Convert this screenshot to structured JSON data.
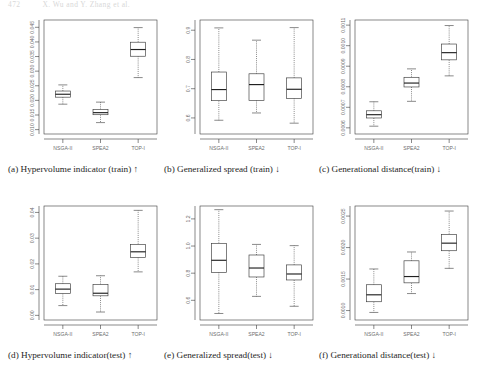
{
  "header": {
    "page_number": "472",
    "title": "X. Wu and Y. Zhang et al."
  },
  "axis": {
    "categories": [
      "NSGA-II",
      "SPEA2",
      "TOP-I"
    ]
  },
  "chart_data": [
    {
      "id": "a",
      "type": "boxplot",
      "title": "",
      "caption_label": "(a)",
      "caption_text": "Hypervolume indicator (train)",
      "caption_arrow": "↑",
      "xlabel": "",
      "ylabel": "",
      "categories": [
        "NSGA-II",
        "SPEA2",
        "TOP-I"
      ],
      "ylim": [
        0.0085,
        0.0475
      ],
      "yticks": [
        0.01,
        0.015,
        0.02,
        0.025,
        0.03,
        0.035,
        0.04,
        0.045
      ],
      "yticklabels": [
        "0.010",
        "0.015",
        "0.020",
        "0.025",
        "0.030",
        "0.035",
        "0.040",
        "0.045"
      ],
      "grid": false,
      "boxes": [
        {
          "name": "NSGA-II",
          "whisker_low": 0.0187,
          "q1": 0.0211,
          "median": 0.0221,
          "q3": 0.0232,
          "whisker_high": 0.0253
        },
        {
          "name": "SPEA2",
          "whisker_low": 0.0124,
          "q1": 0.0151,
          "median": 0.0158,
          "q3": 0.0169,
          "whisker_high": 0.0194
        },
        {
          "name": "TOP-I",
          "whisker_low": 0.0278,
          "q1": 0.0351,
          "median": 0.0374,
          "q3": 0.0399,
          "whisker_high": 0.0449
        }
      ]
    },
    {
      "id": "b",
      "type": "boxplot",
      "title": "",
      "caption_label": "(b)",
      "caption_text": "Generalized spread (train)",
      "caption_arrow": "↓",
      "xlabel": "",
      "ylabel": "",
      "categories": [
        "NSGA-II",
        "SPEA2",
        "TOP-I"
      ],
      "ylim": [
        0.545,
        0.935
      ],
      "yticks": [
        0.6,
        0.7,
        0.8,
        0.9
      ],
      "yticklabels": [
        "0.6",
        "0.7",
        "0.8",
        "0.9"
      ],
      "grid": false,
      "boxes": [
        {
          "name": "NSGA-II",
          "whisker_low": 0.592,
          "q1": 0.659,
          "median": 0.697,
          "q3": 0.757,
          "whisker_high": 0.908
        },
        {
          "name": "SPEA2",
          "whisker_low": 0.617,
          "q1": 0.66,
          "median": 0.714,
          "q3": 0.751,
          "whisker_high": 0.866
        },
        {
          "name": "TOP-I",
          "whisker_low": 0.582,
          "q1": 0.667,
          "median": 0.698,
          "q3": 0.737,
          "whisker_high": 0.909
        }
      ]
    },
    {
      "id": "c",
      "type": "boxplot",
      "title": "",
      "caption_label": "(c)",
      "caption_text": "Generational distance(train)",
      "caption_arrow": "↓",
      "xlabel": "",
      "ylabel": "",
      "categories": [
        "NSGA-II",
        "SPEA2",
        "TOP-I"
      ],
      "ylim": [
        0.00057,
        0.001125
      ],
      "yticks": [
        0.0006,
        0.0007,
        0.0008,
        0.0009,
        0.001,
        0.0011
      ],
      "yticklabels": [
        "0.0006",
        "0.0007",
        "0.0008",
        "0.0009",
        "0.0010",
        "0.0011"
      ],
      "grid": false,
      "boxes": [
        {
          "name": "NSGA-II",
          "whisker_low": 0.000608,
          "q1": 0.000648,
          "median": 0.000664,
          "q3": 0.000683,
          "whisker_high": 0.000727
        },
        {
          "name": "SPEA2",
          "whisker_low": 0.000729,
          "q1": 0.000799,
          "median": 0.000818,
          "q3": 0.000846,
          "whisker_high": 0.000887
        },
        {
          "name": "TOP-I",
          "whisker_low": 0.000853,
          "q1": 0.000931,
          "median": 0.000966,
          "q3": 0.001008,
          "whisker_high": 0.001098
        }
      ]
    },
    {
      "id": "d",
      "type": "boxplot",
      "title": "",
      "caption_label": "(d)",
      "caption_text": "Hypervolume indicator(test)",
      "caption_arrow": "↑",
      "xlabel": "",
      "ylabel": "",
      "categories": [
        "NSGA-II",
        "SPEA2",
        "TOP-I"
      ],
      "ylim": [
        -0.0018,
        0.0425
      ],
      "yticks": [
        0.0,
        0.01,
        0.02,
        0.03,
        0.04
      ],
      "yticklabels": [
        "0.00",
        "0.01",
        "0.02",
        "0.03",
        "0.04"
      ],
      "grid": false,
      "boxes": [
        {
          "name": "NSGA-II",
          "whisker_low": 0.0038,
          "q1": 0.0085,
          "median": 0.0102,
          "q3": 0.0123,
          "whisker_high": 0.0152
        },
        {
          "name": "SPEA2",
          "whisker_low": 0.0013,
          "q1": 0.0076,
          "median": 0.0086,
          "q3": 0.012,
          "whisker_high": 0.0154
        },
        {
          "name": "TOP-I",
          "whisker_low": 0.0169,
          "q1": 0.0225,
          "median": 0.0247,
          "q3": 0.0276,
          "whisker_high": 0.0408
        }
      ]
    },
    {
      "id": "e",
      "type": "boxplot",
      "title": "",
      "caption_label": "(e)",
      "caption_text": "Generalized spread(test)",
      "caption_arrow": "↓",
      "xlabel": "",
      "ylabel": "",
      "categories": [
        "NSGA-II",
        "SPEA2",
        "TOP-I"
      ],
      "ylim": [
        0.455,
        1.295
      ],
      "yticks": [
        0.6,
        0.8,
        1.0,
        1.2
      ],
      "yticklabels": [
        "0.6",
        "0.8",
        "1.0",
        "1.2"
      ],
      "grid": false,
      "boxes": [
        {
          "name": "NSGA-II",
          "whisker_low": 0.503,
          "q1": 0.806,
          "median": 0.895,
          "q3": 1.02,
          "whisker_high": 1.268
        },
        {
          "name": "SPEA2",
          "whisker_low": 0.629,
          "q1": 0.772,
          "median": 0.838,
          "q3": 0.934,
          "whisker_high": 1.012
        },
        {
          "name": "TOP-I",
          "whisker_low": 0.556,
          "q1": 0.75,
          "median": 0.794,
          "q3": 0.861,
          "whisker_high": 1.003
        }
      ]
    },
    {
      "id": "f",
      "type": "boxplot",
      "title": "",
      "caption_label": "(f)",
      "caption_text": "Generational distance(test)",
      "caption_arrow": "↓",
      "xlabel": "",
      "ylabel": "",
      "categories": [
        "NSGA-II",
        "SPEA2",
        "TOP-I"
      ],
      "ylim": [
        0.00085,
        0.00266
      ],
      "yticks": [
        0.001,
        0.0015,
        0.002,
        0.0025
      ],
      "yticklabels": [
        "0.0010",
        "0.0015",
        "0.0020",
        "0.0025"
      ],
      "grid": false,
      "boxes": [
        {
          "name": "NSGA-II",
          "whisker_low": 0.00097,
          "q1": 0.00114,
          "median": 0.00125,
          "q3": 0.00141,
          "whisker_high": 0.00166
        },
        {
          "name": "SPEA2",
          "whisker_low": 0.00127,
          "q1": 0.00144,
          "median": 0.00154,
          "q3": 0.00179,
          "whisker_high": 0.00193
        },
        {
          "name": "TOP-I",
          "whisker_low": 0.00167,
          "q1": 0.00195,
          "median": 0.00207,
          "q3": 0.00221,
          "whisker_high": 0.00258
        }
      ]
    }
  ]
}
